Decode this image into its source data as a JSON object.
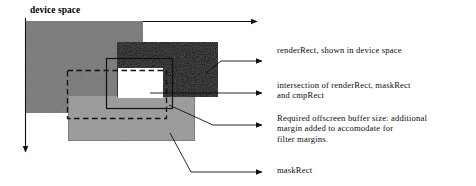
{
  "diagram": {
    "title": "device space",
    "axes": {
      "x_axis_name": "horizontal-device-axis",
      "y_axis_name": "vertical-device-axis"
    },
    "colors": {
      "cmp_rect_fill": "#787878",
      "mask_rect_fill": "#9a9a9a",
      "render_rect_fill": "#171717",
      "intersection_fill": "#ffffff",
      "stroke": "#000000",
      "leader_line": "#111111",
      "background": "#ffffff"
    },
    "shapes": [
      {
        "id": "cmpRect",
        "name": "cmp-rect-shape",
        "fill": "#787878"
      },
      {
        "id": "maskRect",
        "name": "mask-rect-shape",
        "fill": "#9a9a9a"
      },
      {
        "id": "renderRect",
        "name": "render-rect-shape",
        "fill": "#171717"
      },
      {
        "id": "offscreenBuffer",
        "name": "offscreen-buffer-outline",
        "style": "solid-outline"
      },
      {
        "id": "filterMargin",
        "name": "filter-margin-outline",
        "style": "dashed-outline"
      },
      {
        "id": "intersection",
        "name": "intersection-shape",
        "fill": "#ffffff"
      }
    ],
    "labels": {
      "render_rect": "renderRect, shown in device space",
      "intersection": "intersection of renderRect, maskRect\nand cmpRect",
      "offscreen_buffer": "Required offscreen buffer size: additional\nmargin added to accomodate for\nfilter margins.",
      "mask_rect": "maskRect"
    }
  }
}
